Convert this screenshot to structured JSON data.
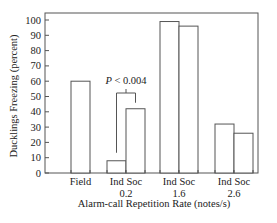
{
  "chart_data": {
    "type": "bar",
    "title": "",
    "xlabel": "Alarm-call Repetition Rate (notes/s)",
    "ylabel": "Ducklings Freezing (percent)",
    "ylim": [
      0,
      100
    ],
    "yticks": [
      0,
      10,
      20,
      30,
      40,
      50,
      60,
      70,
      80,
      90,
      100
    ],
    "grid": false,
    "legend": "none",
    "groups": [
      {
        "label": "Field",
        "rate": "",
        "bars": [
          {
            "name": "Field",
            "value": 60
          }
        ]
      },
      {
        "label": "Ind Soc",
        "rate": "0.2",
        "bars": [
          {
            "name": "Ind",
            "value": 8
          },
          {
            "name": "Soc",
            "value": 42
          }
        ]
      },
      {
        "label": "Ind Soc",
        "rate": "1.6",
        "bars": [
          {
            "name": "Ind",
            "value": 99
          },
          {
            "name": "Soc",
            "value": 96
          }
        ]
      },
      {
        "label": "Ind Soc",
        "rate": "2.6",
        "bars": [
          {
            "name": "Ind",
            "value": 32
          },
          {
            "name": "Soc",
            "value": 26
          }
        ]
      }
    ],
    "annotations": [
      {
        "text_italic": "P",
        "text": " < 0.004",
        "group": "0.2",
        "type": "significance-bracket"
      }
    ]
  }
}
